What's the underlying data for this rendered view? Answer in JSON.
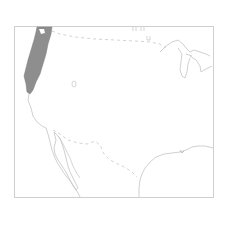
{
  "map": {
    "type": "species-range-map",
    "region": "Western United States and adjacent Mexico / Canada border",
    "colors": {
      "background": "#ffffff",
      "frame": "#c8c8c8",
      "coastline": "#c4c4c4",
      "border_dashed": "#c8c8c8",
      "range_fill": "#8a8a8a"
    },
    "features": {
      "range": "shaded-range-pacific-coast",
      "coastline": "pacific-coast-and-baja",
      "great_lakes": "great-lakes-outline",
      "gulf_coast": "gulf-of-mexico-coast",
      "us_canada_border": "dashed-border-north",
      "us_mexico_border": "dashed-border-south",
      "isolated_point": "small-outline-marker"
    },
    "labels": []
  }
}
